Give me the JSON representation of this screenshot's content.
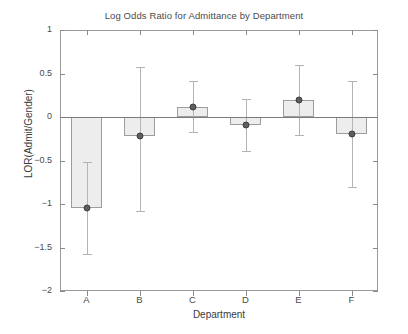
{
  "chart_data": {
    "type": "bar",
    "title": "Log Odds Ratio for Admittance by Department",
    "xlabel": "Department",
    "ylabel": "LOR(Admit/Gender)",
    "categories": [
      "A",
      "B",
      "C",
      "D",
      "E",
      "F"
    ],
    "values": [
      -1.05,
      -0.22,
      0.12,
      -0.09,
      0.19,
      -0.2
    ],
    "errors_low": [
      -1.57,
      -1.08,
      -0.17,
      -0.39,
      -0.21,
      -0.8
    ],
    "errors_high": [
      -0.52,
      0.57,
      0.41,
      0.21,
      0.6,
      0.41
    ],
    "ylim": [
      -2,
      1
    ],
    "yticks": [
      1,
      0.5,
      0,
      -0.5,
      -1,
      -1.5,
      -2
    ],
    "ytick_labels": [
      "1",
      "0.5",
      "0",
      "-0.5",
      "-1",
      "-1.5",
      "-2"
    ],
    "xtick_labels": [
      "A",
      "B",
      "C",
      "D",
      "E",
      "F"
    ],
    "grid": false,
    "legend": "none",
    "bar_fill_color": "#ededed",
    "bar_edge_color": "#9d9d9d",
    "marker_color": "#5e5e5e",
    "errorbar_color": "#b4b4b4",
    "axis_color": "#9a9a9a",
    "zero_line": 0
  }
}
